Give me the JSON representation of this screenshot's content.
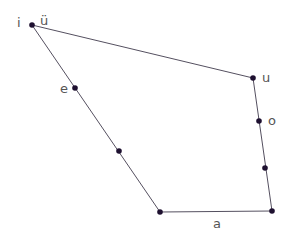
{
  "diagram": {
    "colors": {
      "edge": "#555060",
      "point": "#1e1030",
      "label": "#555555"
    },
    "vertices": [
      {
        "id": "i"
      },
      {
        "id": "u"
      },
      {
        "id": "a_right"
      },
      {
        "id": "a_left"
      }
    ],
    "points": [
      {
        "id": "i",
        "label": "i"
      },
      {
        "id": "ü",
        "label": "ü"
      },
      {
        "id": "e",
        "label": "e"
      },
      {
        "id": "e_lower",
        "label": ""
      },
      {
        "id": "a_left",
        "label": ""
      },
      {
        "id": "a",
        "label": "a"
      },
      {
        "id": "u",
        "label": "u"
      },
      {
        "id": "o",
        "label": "o"
      },
      {
        "id": "o_lower",
        "label": ""
      }
    ],
    "labels": {
      "i": "i",
      "ü": "ü",
      "e": "e",
      "u": "u",
      "o": "o",
      "a": "a"
    }
  }
}
